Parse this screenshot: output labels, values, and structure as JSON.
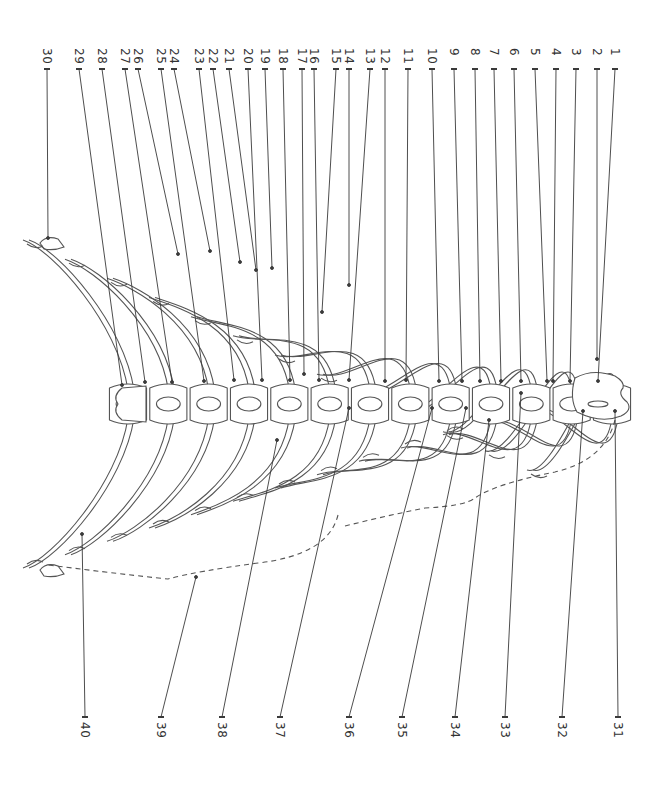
{
  "figure": {
    "line_color": "#4a4a4a",
    "leader_color": "#3a3a3a",
    "bracket_style": "dashed"
  },
  "labels_top": [
    {
      "n": "30",
      "x": 47,
      "tx": 48,
      "ty": 238
    },
    {
      "n": "29",
      "x": 79,
      "tx": 122,
      "ty": 385
    },
    {
      "n": "28",
      "x": 102,
      "tx": 145,
      "ty": 382
    },
    {
      "n": "27",
      "x": 125,
      "tx": 172,
      "ty": 382
    },
    {
      "n": "26",
      "x": 138,
      "tx": 178,
      "ty": 254
    },
    {
      "n": "25",
      "x": 161,
      "tx": 204,
      "ty": 381
    },
    {
      "n": "24",
      "x": 174,
      "tx": 210,
      "ty": 251
    },
    {
      "n": "23",
      "x": 199,
      "tx": 234,
      "ty": 380
    },
    {
      "n": "22",
      "x": 213,
      "tx": 240,
      "ty": 262
    },
    {
      "n": "21",
      "x": 229,
      "tx": 256,
      "ty": 270
    },
    {
      "n": "20",
      "x": 248,
      "tx": 262,
      "ty": 380
    },
    {
      "n": "19",
      "x": 265,
      "tx": 272,
      "ty": 268
    },
    {
      "n": "18",
      "x": 283,
      "tx": 290,
      "ty": 380
    },
    {
      "n": "17",
      "x": 302,
      "tx": 304,
      "ty": 374
    },
    {
      "n": "16",
      "x": 314,
      "tx": 319,
      "ty": 380
    },
    {
      "n": "15",
      "x": 336,
      "tx": 322,
      "ty": 312
    },
    {
      "n": "14",
      "x": 349,
      "tx": 349,
      "ty": 285
    },
    {
      "n": "13",
      "x": 370,
      "tx": 349,
      "ty": 380
    },
    {
      "n": "12",
      "x": 385,
      "tx": 385,
      "ty": 381
    },
    {
      "n": "11",
      "x": 408,
      "tx": 406,
      "ty": 380
    },
    {
      "n": "10",
      "x": 432,
      "tx": 439,
      "ty": 381
    },
    {
      "n": "9",
      "x": 454,
      "tx": 462,
      "ty": 381
    },
    {
      "n": "8",
      "x": 475,
      "tx": 480,
      "ty": 381
    },
    {
      "n": "7",
      "x": 494,
      "tx": 501,
      "ty": 381
    },
    {
      "n": "6",
      "x": 514,
      "tx": 521,
      "ty": 381
    },
    {
      "n": "5",
      "x": 535,
      "tx": 547,
      "ty": 381
    },
    {
      "n": "4",
      "x": 556,
      "tx": 553,
      "ty": 381
    },
    {
      "n": "3",
      "x": 576,
      "tx": 570,
      "ty": 381
    },
    {
      "n": "2",
      "x": 597,
      "tx": 597,
      "ty": 359
    },
    {
      "n": "1",
      "x": 615,
      "tx": 598,
      "ty": 381
    }
  ],
  "labels_bottom": [
    {
      "n": "40",
      "x": 85,
      "tx": 82,
      "ty": 534
    },
    {
      "n": "39",
      "x": 161,
      "tx": 196,
      "ty": 577
    },
    {
      "n": "38",
      "x": 222,
      "tx": 277,
      "ty": 440
    },
    {
      "n": "37",
      "x": 280,
      "tx": 349,
      "ty": 408
    },
    {
      "n": "36",
      "x": 349,
      "tx": 432,
      "ty": 408
    },
    {
      "n": "35",
      "x": 402,
      "tx": 466,
      "ty": 408
    },
    {
      "n": "34",
      "x": 455,
      "tx": 489,
      "ty": 420
    },
    {
      "n": "33",
      "x": 505,
      "tx": 521,
      "ty": 393
    },
    {
      "n": "32",
      "x": 562,
      "tx": 583,
      "ty": 411
    },
    {
      "n": "31",
      "x": 618,
      "tx": 615,
      "ty": 411
    }
  ]
}
